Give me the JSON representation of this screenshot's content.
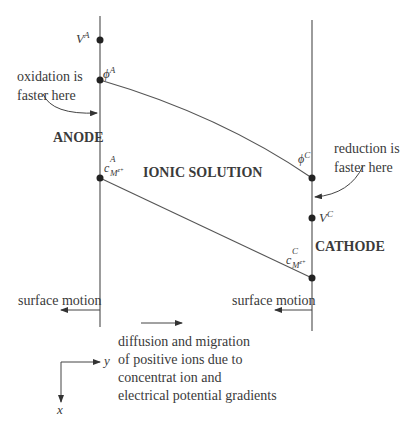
{
  "diagram": {
    "electrodes": {
      "anode": {
        "label": "ANODE",
        "annotation": [
          "oxidation is",
          "faster here"
        ],
        "points": {
          "V": {
            "symbol": "V",
            "superscript": "A"
          },
          "phi": {
            "symbol": "ϕ",
            "superscript": "A"
          },
          "c": {
            "symbol": "c",
            "superscript": "A",
            "subscript": "M",
            "subscript_sup": "z+"
          }
        },
        "surface_motion": "surface motion"
      },
      "cathode": {
        "label": "CATHODE",
        "annotation": [
          "reduction is",
          "faster here"
        ],
        "points": {
          "V": {
            "symbol": "V",
            "superscript": "C"
          },
          "phi": {
            "symbol": "ϕ",
            "superscript": "C"
          },
          "c": {
            "symbol": "c",
            "superscript": "C",
            "subscript": "M",
            "subscript_sup": "z+"
          }
        },
        "surface_motion": "surface motion"
      }
    },
    "solution_label": "IONIC SOLUTION",
    "transport_text": "diffusion and migration\nof positive ions due to\nconcentrat ion and\nelectrical potential gradients",
    "axes": {
      "horizontal": "y",
      "vertical": "x"
    },
    "colors": {
      "line": "#555555",
      "dot": "#222222",
      "text": "#3a3a3a"
    }
  }
}
